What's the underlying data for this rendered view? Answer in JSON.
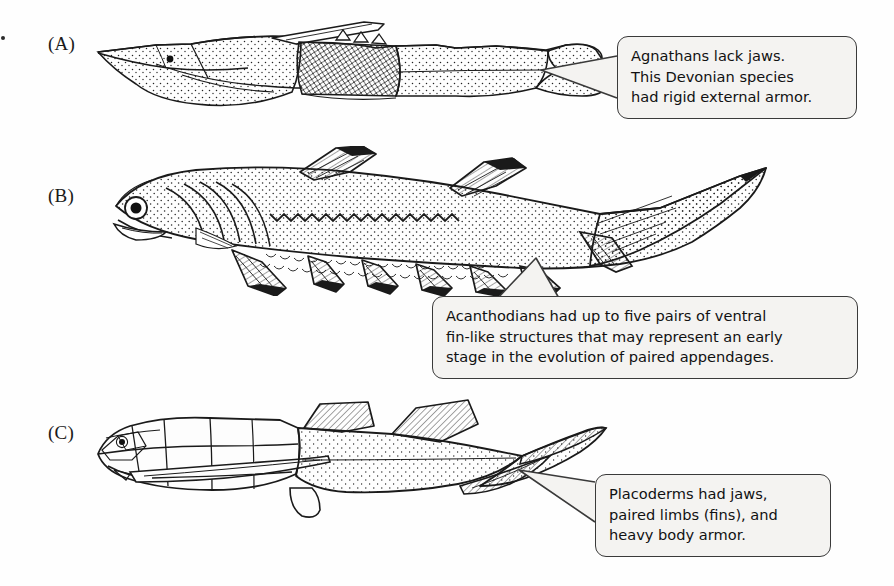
{
  "figure": {
    "background_color": "#fefefe",
    "ink_color": "#1a1a1a",
    "callout_fill": "#f4f3f1",
    "callout_border": "#3a3a3a"
  },
  "panels": [
    {
      "id": "A",
      "label": "(A)",
      "subject": "agnathan-ostracoderm"
    },
    {
      "id": "B",
      "label": "(B)",
      "subject": "acanthodian"
    },
    {
      "id": "C",
      "label": "(C)",
      "subject": "placoderm"
    }
  ],
  "callouts": [
    {
      "id": "callout-a",
      "lines": [
        "Agnathans lack jaws.",
        "This Devonian species",
        "had rigid external armor."
      ]
    },
    {
      "id": "callout-b",
      "lines": [
        "Acanthodians had up to five pairs of ventral",
        "fin-like structures that may represent an early",
        "stage in the evolution of paired appendages."
      ]
    },
    {
      "id": "callout-c",
      "lines": [
        "Placoderms had jaws,",
        "paired limbs (fins), and",
        "heavy body armor."
      ]
    }
  ]
}
